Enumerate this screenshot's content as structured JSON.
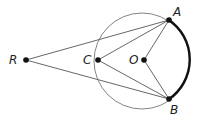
{
  "diagram": {
    "points": {
      "R": {
        "label": "R",
        "x": 26,
        "y": 60
      },
      "C": {
        "label": "C",
        "x": 98,
        "y": 60
      },
      "O": {
        "label": "O",
        "x": 144,
        "y": 60
      },
      "A": {
        "label": "A",
        "x": 169,
        "y": 20
      },
      "B": {
        "label": "B",
        "x": 169,
        "y": 99
      }
    },
    "circle": {
      "center": "O",
      "radius": 48
    },
    "segments": [
      "RA",
      "RB",
      "CA",
      "CB",
      "OA",
      "OB"
    ],
    "highlighted_arc": "AB",
    "colors": {
      "line": "#555555",
      "arc": "#111111",
      "point": "#111111"
    }
  }
}
